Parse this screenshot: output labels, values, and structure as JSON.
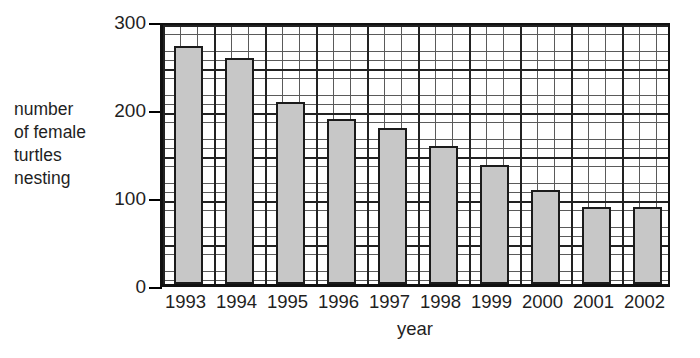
{
  "chart_data": {
    "type": "bar",
    "title": "",
    "categories": [
      "1993",
      "1994",
      "1995",
      "1996",
      "1997",
      "1998",
      "1999",
      "2000",
      "2001",
      "2002"
    ],
    "values": [
      270,
      257,
      207,
      188,
      177,
      157,
      135,
      107,
      88,
      87
    ],
    "xlabel": "year",
    "ylabel": "number\nof female\nturtles\nnesting",
    "ylim": [
      0,
      300
    ],
    "yticks": [
      0,
      100,
      200,
      300
    ],
    "ytick_labels": [
      "0",
      "100",
      "200",
      "300"
    ],
    "grid": true,
    "grid_minor_step": 10,
    "grid_major_step": 50,
    "legend": "none",
    "bar_fill_color": "#c7c7c7",
    "bar_edge_color": "#1b1b1b",
    "axis_color": "#111111",
    "grid_minor_color": "#5a5a5a",
    "grid_major_color": "#222222"
  }
}
